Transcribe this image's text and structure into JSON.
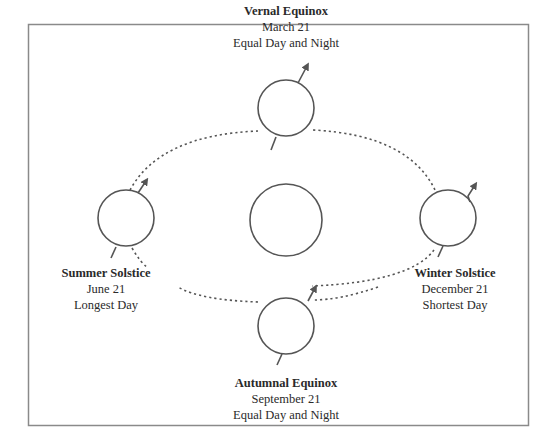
{
  "diagram": {
    "colors": {
      "line": "#555555",
      "frame": "#8a8a8a",
      "text": "#2a2a2a",
      "background": "#ffffff"
    },
    "sun": {
      "label": ""
    },
    "positions": {
      "vernal": {
        "name": "Vernal Equinox",
        "date": "March 21",
        "description": "Equal Day and Night"
      },
      "summer": {
        "name": "Summer Solstice",
        "date": "June 21",
        "description": "Longest Day"
      },
      "winter": {
        "name": "Winter Solstice",
        "date": "December 21",
        "description": "Shortest Day"
      },
      "autumnal": {
        "name": "Autumnal Equinox",
        "date": "September 21",
        "description": "Equal Day and Night"
      }
    }
  }
}
